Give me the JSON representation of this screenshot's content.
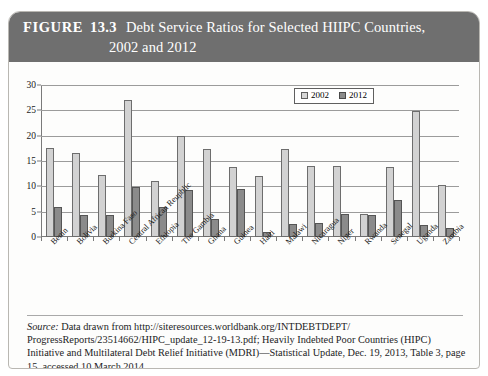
{
  "figure": {
    "label": "FIGURE",
    "number": "13.3",
    "title_line1": "Debt Service Ratios for Selected HIIPC Countries,",
    "title_line2": "2002 and 2012",
    "header_color": "#6f6f6f"
  },
  "legend": {
    "items": [
      {
        "label": "2002",
        "color": "#d6d6d6"
      },
      {
        "label": "2012",
        "color": "#8b8b8b"
      }
    ]
  },
  "source": {
    "label": "Source:",
    "text": " Data drawn from http://siteresources.worldbank.org/INTDEBTDEPT/ ProgressReports/23514662/HIPC_update_12-19-13.pdf; Heavily Indebted Poor Countries (HIPC) Initiative and Multilateral Debt Relief Initiative (MDRI)—Statistical Update, Dec. 19, 2013, Table 3, page 15, accessed 10 March 2014. ."
  },
  "chart_data": {
    "type": "bar",
    "title": "Debt Service Ratios for Selected HIIPC Countries, 2002 and 2012",
    "xlabel": "",
    "ylabel": "",
    "ylim": [
      0,
      30
    ],
    "yticks": [
      0,
      5,
      10,
      15,
      20,
      25,
      30
    ],
    "grid": true,
    "legend_position": "top-right",
    "categories": [
      "Benin",
      "Bolivia",
      "Burkina Faso",
      "Central African Reupblic",
      "Ethiopia",
      "The Gambia",
      "Ghana",
      "Guinea",
      "Haiti",
      "Malawi",
      "Nicaragua",
      "Niger",
      "Rwanda",
      "Senegal",
      "Uganda",
      "Zambia"
    ],
    "series": [
      {
        "name": "2002",
        "color": "#d2d2d2",
        "values": [
          17.5,
          16.5,
          12.3,
          27.0,
          11.0,
          20.0,
          17.3,
          13.8,
          12.0,
          17.3,
          14.0,
          14.0,
          4.5,
          13.8,
          24.8,
          10.2
        ]
      },
      {
        "name": "2012",
        "color": "#8b8b8b",
        "values": [
          6.0,
          4.3,
          4.3,
          9.8,
          6.0,
          9.3,
          3.5,
          9.5,
          1.0,
          2.5,
          2.8,
          4.5,
          4.3,
          7.3,
          2.3,
          1.8
        ]
      }
    ]
  }
}
